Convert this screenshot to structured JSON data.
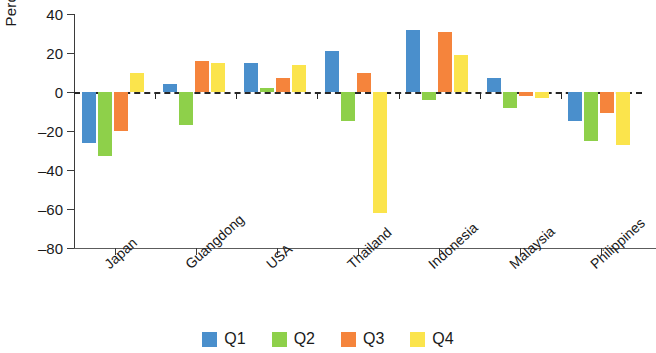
{
  "chart_data": {
    "type": "bar",
    "title": "",
    "xlabel": "",
    "ylabel": "Percent",
    "ylim": [
      -80,
      40
    ],
    "yticks": [
      40,
      20,
      0,
      -20,
      -40,
      -60,
      -80
    ],
    "ytick_labels": [
      "40",
      "20",
      "0",
      "–20",
      "–40",
      "–60",
      "–80"
    ],
    "grid": false,
    "zero_line": true,
    "legend_position": "bottom",
    "categories": [
      "Japan",
      "Guangdong",
      "USA",
      "Thailand",
      "Indonesia",
      "Malaysia",
      "Philippines"
    ],
    "series": [
      {
        "name": "Q1",
        "color": "#4a8fcc",
        "values": [
          -26,
          4,
          15,
          21,
          32,
          7,
          -15
        ]
      },
      {
        "name": "Q2",
        "color": "#8ed04a",
        "values": [
          -33,
          -17,
          2,
          -15,
          -4,
          -8,
          -25
        ]
      },
      {
        "name": "Q3",
        "color": "#f5843c",
        "values": [
          -20,
          16,
          7,
          10,
          31,
          -2,
          -11
        ]
      },
      {
        "name": "Q4",
        "color": "#fbe44c",
        "values": [
          10,
          15,
          14,
          -62,
          19,
          -3,
          -27
        ]
      }
    ]
  },
  "legend": {
    "items": [
      {
        "label": "Q1",
        "color": "#4a8fcc"
      },
      {
        "label": "Q2",
        "color": "#8ed04a"
      },
      {
        "label": "Q3",
        "color": "#f5843c"
      },
      {
        "label": "Q4",
        "color": "#fbe44c"
      }
    ]
  }
}
